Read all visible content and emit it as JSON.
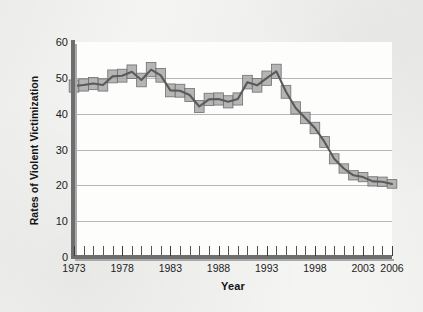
{
  "figure": {
    "background_color": "#f4f4f2",
    "plot_background_color": "#fdfdfc",
    "axis_color": "#6e6e6e",
    "gridline_color": "#b6b6b6"
  },
  "axis_titles": {
    "y": "Rates of Violent Victimization",
    "x": "Year"
  },
  "chart_data": {
    "type": "line",
    "title": "",
    "subtitle": "",
    "xlabel": "Year",
    "ylabel": "Rates of Violent Victimization",
    "xlim": [
      1973,
      2006
    ],
    "ylim": [
      0,
      60
    ],
    "grid": true,
    "legend": false,
    "legend_position": "none",
    "y_ticks": [
      0,
      10,
      20,
      30,
      40,
      50,
      60
    ],
    "y_tick_labels": [
      "0",
      "10",
      "20",
      "30",
      "40",
      "50",
      "60"
    ],
    "x_tick_labels_shown": [
      "1973",
      "1978",
      "1983",
      "1988",
      "1993",
      "1998",
      "2003",
      "2006"
    ],
    "x_tick_values_shown": [
      1973,
      1978,
      1983,
      1988,
      1993,
      1998,
      2003,
      2006
    ],
    "x_minor_ticks_every": 1,
    "series": [
      {
        "name": "Rate of violent victimization",
        "type": "line",
        "color": "#5a5a5a",
        "x": [
          1973,
          1974,
          1975,
          1976,
          1977,
          1978,
          1979,
          1980,
          1981,
          1982,
          1983,
          1984,
          1985,
          1986,
          1987,
          1988,
          1989,
          1990,
          1991,
          1992,
          1993,
          1994,
          1995,
          1996,
          1997,
          1998,
          1999,
          2000,
          2001,
          2002,
          2003,
          2004,
          2005,
          2006
        ],
        "values": [
          47.7,
          48.0,
          48.4,
          48.0,
          50.4,
          50.6,
          51.7,
          49.4,
          52.3,
          50.7,
          46.5,
          46.4,
          45.2,
          42.0,
          44.0,
          44.1,
          43.3,
          44.1,
          48.8,
          47.9,
          49.9,
          51.8,
          46.1,
          41.6,
          38.8,
          36.0,
          32.1,
          27.4,
          24.7,
          22.8,
          22.3,
          21.1,
          21.0,
          20.4
        ]
      }
    ],
    "confidence_band": {
      "name": "Confidence interval band",
      "style": "step",
      "fill_color": "#a8a8a8",
      "edge_color": "#6f6f6f",
      "lower": [
        46.0,
        46.3,
        46.7,
        46.3,
        48.6,
        48.8,
        49.8,
        47.5,
        50.3,
        48.8,
        44.7,
        44.6,
        43.4,
        40.3,
        42.3,
        42.4,
        41.6,
        42.4,
        46.9,
        46.0,
        47.9,
        49.8,
        44.3,
        39.9,
        37.2,
        34.4,
        30.6,
        26.0,
        23.4,
        21.5,
        21.0,
        19.8,
        19.7,
        19.2
      ],
      "upper": [
        49.4,
        49.7,
        50.1,
        49.7,
        52.2,
        52.4,
        53.6,
        51.3,
        54.3,
        52.6,
        48.3,
        48.2,
        47.0,
        43.7,
        45.7,
        45.8,
        45.0,
        45.8,
        50.7,
        49.8,
        51.9,
        53.8,
        47.9,
        43.3,
        40.4,
        37.6,
        33.6,
        28.8,
        26.0,
        24.1,
        23.6,
        22.4,
        22.3,
        21.6
      ]
    }
  }
}
